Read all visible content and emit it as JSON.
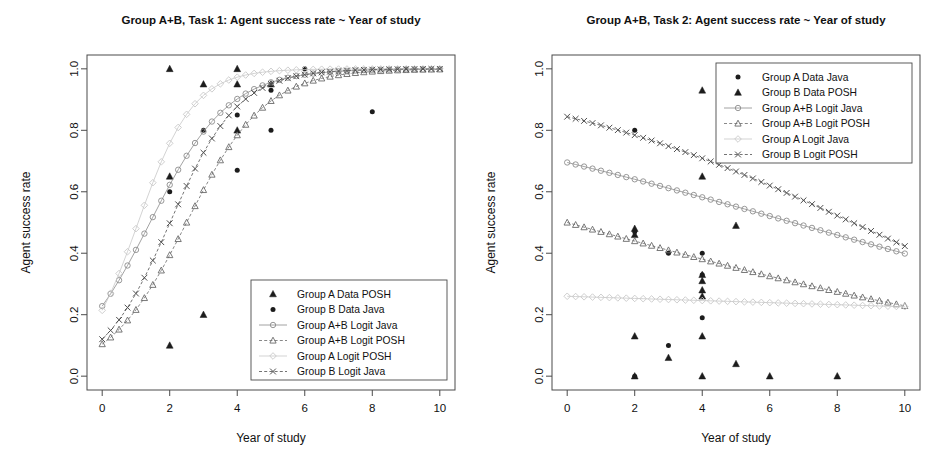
{
  "chart_data": [
    {
      "type": "scatter",
      "panel": "left",
      "title": "Group A+B, Task 1: Agent success rate ~ Year of study",
      "xlabel": "Year of study",
      "ylabel": "Agent success rate",
      "xlim": [
        -0.45,
        10.45
      ],
      "ylim": [
        -0.045,
        1.045
      ],
      "xticks": [
        0,
        2,
        4,
        6,
        8,
        10
      ],
      "xticklabels": [
        "0",
        "2",
        "4",
        "6",
        "8",
        "10"
      ],
      "yticks": [
        0.0,
        0.2,
        0.4,
        0.6,
        0.8,
        1.0
      ],
      "yticklabels": [
        "0.0",
        "0.2",
        "0.4",
        "0.6",
        "0.8",
        "1.0"
      ],
      "grid": false,
      "legend_position": "bottom-right",
      "series": [
        {
          "name": "Group A    Data POSH",
          "group": "Group A",
          "kind": "Data POSH",
          "marker": "filled-triangle",
          "line": "none",
          "color": "#1c1c1c",
          "points": [
            [
              2,
              1.0
            ],
            [
              2,
              0.65
            ],
            [
              2,
              0.1
            ],
            [
              3,
              0.95
            ],
            [
              3,
              0.2
            ],
            [
              4,
              1.0
            ],
            [
              4,
              0.95
            ],
            [
              4,
              0.8
            ],
            [
              5,
              0.95
            ]
          ]
        },
        {
          "name": "Group B    Data Java",
          "group": "Group B",
          "kind": "Data Java",
          "marker": "filled-circle",
          "line": "none",
          "color": "#1c1c1c",
          "points": [
            [
              2,
              0.6
            ],
            [
              3,
              0.8
            ],
            [
              4,
              0.85
            ],
            [
              4,
              0.67
            ],
            [
              5,
              0.93
            ],
            [
              5,
              0.8
            ],
            [
              6,
              1.0
            ],
            [
              8,
              0.86
            ]
          ]
        },
        {
          "name": "Group A+B Logit Java",
          "group": "Group A+B",
          "kind": "Logit Java",
          "marker": "open-circle",
          "line": "solid",
          "color": "#8c8c8c",
          "logistic": {
            "intercept": -1.22,
            "slope": 0.86,
            "n": 41
          }
        },
        {
          "name": "Group A+B Logit POSH",
          "group": "Group A+B",
          "kind": "Logit POSH",
          "marker": "open-triangle",
          "line": "dashed",
          "color": "#6a6a6a",
          "logistic": {
            "intercept": -2.15,
            "slope": 0.86,
            "n": 41
          }
        },
        {
          "name": "Group A    Logit POSH",
          "group": "Group A",
          "kind": "Logit POSH",
          "marker": "open-diamond",
          "line": "solid",
          "color": "#c8c8c8",
          "logistic": {
            "intercept": -1.3,
            "slope": 1.22,
            "n": 41
          }
        },
        {
          "name": "Group B    Logit Java",
          "group": "Group B",
          "kind": "Logit Java",
          "marker": "x-cross",
          "line": "dashed",
          "color": "#4f4f4f",
          "logistic": {
            "intercept": -1.99,
            "slope": 0.99,
            "n": 41
          }
        }
      ]
    },
    {
      "type": "scatter",
      "panel": "right",
      "title": "Group A+B, Task 2: Agent success rate ~ Year of study",
      "xlabel": "Year of study",
      "ylabel": "Agent success rate",
      "xlim": [
        -0.45,
        10.45
      ],
      "ylim": [
        -0.045,
        1.045
      ],
      "xticks": [
        0,
        2,
        4,
        6,
        8,
        10
      ],
      "xticklabels": [
        "0",
        "2",
        "4",
        "6",
        "8",
        "10"
      ],
      "yticks": [
        0.0,
        0.2,
        0.4,
        0.6,
        0.8,
        1.0
      ],
      "yticklabels": [
        "0.0",
        "0.2",
        "0.4",
        "0.6",
        "0.8",
        "1.0"
      ],
      "grid": false,
      "legend_position": "top-right",
      "series": [
        {
          "name": "Group A    Data Java",
          "group": "Group A",
          "kind": "Data Java",
          "marker": "filled-circle",
          "line": "none",
          "color": "#1c1c1c",
          "points": [
            [
              2,
              0.8
            ],
            [
              2,
              0.47
            ],
            [
              2,
              0.0
            ],
            [
              3,
              0.4
            ],
            [
              3,
              0.1
            ],
            [
              4,
              0.4
            ],
            [
              4,
              0.33
            ],
            [
              4,
              0.19
            ],
            [
              5,
              0.78
            ]
          ]
        },
        {
          "name": "Group B    Data POSH",
          "group": "Group B",
          "kind": "Data POSH",
          "marker": "filled-triangle",
          "line": "none",
          "color": "#1c1c1c",
          "points": [
            [
              2,
              0.48
            ],
            [
              2,
              0.46
            ],
            [
              2,
              0.13
            ],
            [
              2,
              0.0
            ],
            [
              3,
              0.06
            ],
            [
              4,
              0.93
            ],
            [
              4,
              0.65
            ],
            [
              4,
              0.33
            ],
            [
              4,
              0.31
            ],
            [
              4,
              0.28
            ],
            [
              4,
              0.26
            ],
            [
              4,
              0.13
            ],
            [
              4,
              0.0
            ],
            [
              5,
              0.85
            ],
            [
              5,
              0.49
            ],
            [
              5,
              0.04
            ],
            [
              6,
              0.0
            ],
            [
              8,
              0.0
            ]
          ]
        },
        {
          "name": "Group A+B Logit Java",
          "group": "Group A+B",
          "kind": "Logit Java",
          "marker": "open-circle",
          "line": "solid",
          "color": "#8c8c8c",
          "logistic": {
            "intercept": 0.825,
            "slope": -0.1235,
            "n": 41
          }
        },
        {
          "name": "Group A+B Logit POSH",
          "group": "Group A+B",
          "kind": "Logit POSH",
          "marker": "open-triangle",
          "line": "dashed",
          "color": "#6a6a6a",
          "logistic": {
            "intercept": 0.0,
            "slope": -0.1215,
            "n": 41
          }
        },
        {
          "name": "Group A    Logit Java",
          "group": "Group A",
          "kind": "Logit Java",
          "marker": "open-diamond",
          "line": "solid",
          "color": "#c8c8c8",
          "logistic": {
            "intercept": -1.046,
            "slope": -0.0185,
            "n": 41
          }
        },
        {
          "name": "Group B    Logit POSH",
          "group": "Group B",
          "kind": "Logit POSH",
          "marker": "x-cross",
          "line": "dashed",
          "color": "#4f4f4f",
          "logistic": {
            "intercept": 1.69,
            "slope": -0.2,
            "n": 41
          }
        }
      ]
    }
  ],
  "figure": {
    "background": "#ffffff",
    "axis_color": "#4a4a4a",
    "text_color": "#111111"
  }
}
